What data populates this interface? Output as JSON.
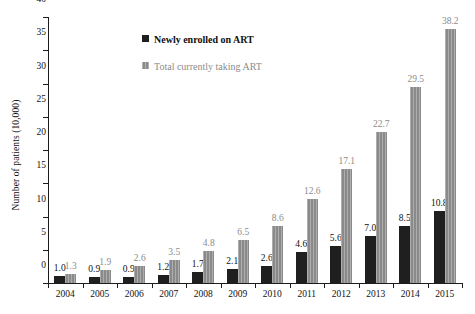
{
  "chart_data": {
    "type": "bar",
    "title": "",
    "xlabel": "",
    "ylabel": "Number of patients (10,000)",
    "ylim": [
      0,
      40
    ],
    "yticks": [
      0,
      5,
      10,
      15,
      20,
      25,
      30,
      35,
      40
    ],
    "grid": false,
    "legend_position": "top-center",
    "categories": [
      "2004",
      "2005",
      "2006",
      "2007",
      "2008",
      "2009",
      "2010",
      "2011",
      "2012",
      "2013",
      "2014",
      "2015"
    ],
    "series": [
      {
        "name": "Newly enrolled on ART",
        "color": "#1f1f1f",
        "values": [
          1.0,
          0.9,
          0.9,
          1.2,
          1.7,
          2.1,
          2.6,
          4.6,
          5.6,
          7.0,
          8.5,
          10.8
        ],
        "labels": [
          "1.0",
          "0.9",
          "0.9",
          "1.2",
          "1.7",
          "2.1",
          "2.6",
          "4.6",
          "5.6",
          "7.0",
          "8.5",
          "10.8"
        ]
      },
      {
        "name": "Total currently taking ART",
        "color": "#8a8a8a",
        "values": [
          1.3,
          1.9,
          2.6,
          3.5,
          4.8,
          6.5,
          8.6,
          12.6,
          17.1,
          22.7,
          29.5,
          38.2
        ],
        "labels": [
          "1.3",
          "1.9",
          "2.6",
          "3.5",
          "4.8",
          "6.5",
          "8.6",
          "12.6",
          "17.1",
          "22.7",
          "29.5",
          "38.2"
        ]
      }
    ],
    "ytick_labels": [
      "0",
      "5",
      "10",
      "15",
      "20",
      "25",
      "30",
      "35",
      "40"
    ]
  }
}
